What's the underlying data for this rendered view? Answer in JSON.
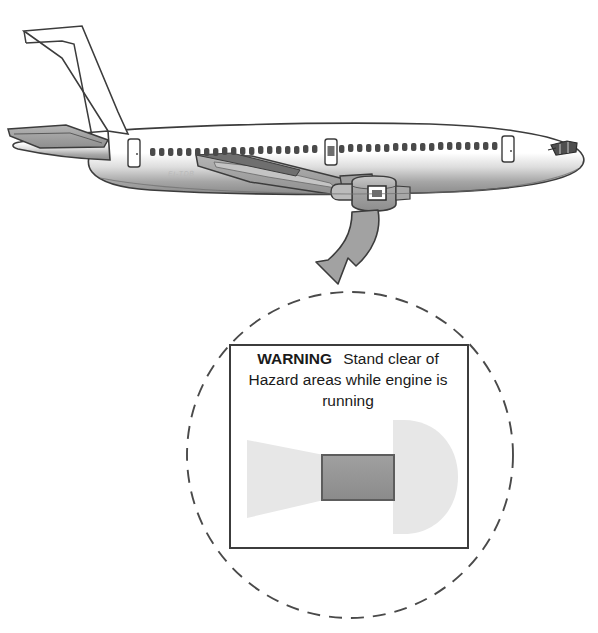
{
  "illustration": {
    "title": "Aircraft engine hazard area warning placard",
    "subject": "twin-engine jet airliner, left side view",
    "registration_marking": "EI-TDB"
  },
  "callout": {
    "source_label": "engine-nacelle-placard",
    "arrow": "curved-arrow-down-left",
    "magnifier": "dashed-circle"
  },
  "placard": {
    "warning_word": "WARNING",
    "line1_rest": "Stand clear of",
    "line2": "Hazard areas while engine is",
    "line3": "running",
    "full_text": "WARNING Stand clear of Hazard areas while engine is running",
    "diagram": {
      "engine_label": "engine-body",
      "intake_hazard_label": "intake-hazard-zone",
      "exhaust_hazard_label": "exhaust-hazard-zone"
    }
  },
  "colors": {
    "ink": "#1a1a1a",
    "outline": "#3c3c3c",
    "engine_gray": "#8f8f8f",
    "hazard_gray": "#e7e7e7",
    "wing_gray": "#9a9a9a",
    "arrow_gray": "#a2a2a2",
    "fuselage_shadow": "#8a8a8a",
    "background": "#ffffff"
  }
}
